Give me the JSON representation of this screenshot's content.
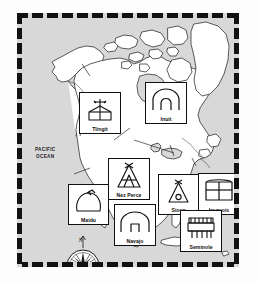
{
  "map": {
    "title": "Native American Tribes of North America",
    "frame_color": "#121212",
    "ocean_color": "#d8d8d8",
    "land_color": "#ffffff",
    "ocean_labels": [
      {
        "name": "pacific-ocean",
        "line1": "PACIFIC",
        "line2": "OCEAN"
      },
      {
        "name": "atlantic-ocean",
        "line1": "ATLANTIC",
        "line2": "OCEAN"
      }
    ],
    "compass": {
      "name": "compass-rose",
      "north_letter": "N"
    },
    "tribes": [
      {
        "id": "tlingit",
        "label": "Tlingit",
        "icon": "plank-house-icon",
        "x": 57,
        "y": 74,
        "w": 42,
        "h": 42
      },
      {
        "id": "inuit",
        "label": "Inuit",
        "icon": "igloo-icon",
        "x": 123,
        "y": 64,
        "w": 42,
        "h": 42
      },
      {
        "id": "nez-perce",
        "label": "Nez Perce",
        "icon": "tipi-poles-icon",
        "x": 86,
        "y": 140,
        "w": 42,
        "h": 42
      },
      {
        "id": "maidu",
        "label": "Maidu",
        "icon": "earth-lodge-icon",
        "x": 46,
        "y": 166,
        "w": 41,
        "h": 41
      },
      {
        "id": "navajo",
        "label": "Navajo",
        "icon": "hogan-icon",
        "x": 92,
        "y": 186,
        "w": 42,
        "h": 42
      },
      {
        "id": "sioux",
        "label": "Sioux",
        "icon": "tipi-icon",
        "x": 136,
        "y": 156,
        "w": 41,
        "h": 41
      },
      {
        "id": "iroquois",
        "label": "Iroquois",
        "icon": "longhouse-icon",
        "x": 176,
        "y": 155,
        "w": 42,
        "h": 42
      },
      {
        "id": "seminole",
        "label": "Seminole",
        "icon": "chickee-icon",
        "x": 158,
        "y": 192,
        "w": 42,
        "h": 42
      }
    ]
  }
}
